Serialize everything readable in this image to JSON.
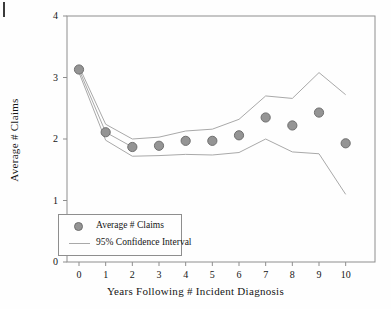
{
  "chart_data": {
    "type": "scatter",
    "title": "",
    "xlabel": "Years Following # Incident Diagnosis",
    "ylabel": "Average # Claims",
    "xlim": [
      -0.45,
      11.1
    ],
    "ylim": [
      0,
      4
    ],
    "xticks": [
      0,
      1,
      2,
      3,
      4,
      5,
      6,
      7,
      8,
      9,
      10
    ],
    "xtick_labels": [
      "0",
      "1",
      "2",
      "3",
      "4",
      "5",
      "6",
      "7",
      "8",
      "9",
      "10"
    ],
    "yticks": [
      0,
      1,
      2,
      3,
      4
    ],
    "ytick_labels": [
      "0",
      "1",
      "2",
      "3",
      "4"
    ],
    "grid": false,
    "legend_position": "lower left",
    "x": [
      0,
      1,
      2,
      3,
      4,
      5,
      6,
      7,
      8,
      9,
      10
    ],
    "series": [
      {
        "name": "Average # Claims",
        "style": "marker",
        "color": "#949494",
        "edge_color": "#6f6f6f",
        "values": [
          3.13,
          2.11,
          1.87,
          1.89,
          1.97,
          1.97,
          2.06,
          2.35,
          2.22,
          2.43,
          1.93
        ]
      },
      {
        "name": "95% Confidence Interval Upper",
        "style": "line",
        "color": "#a9a9a9",
        "values": [
          3.18,
          2.24,
          2.0,
          2.03,
          2.13,
          2.16,
          2.32,
          2.7,
          2.66,
          3.08,
          2.72
        ]
      },
      {
        "name": "95% Confidence Interval Lower",
        "style": "line",
        "color": "#a9a9a9",
        "values": [
          3.08,
          1.98,
          1.72,
          1.73,
          1.75,
          1.74,
          1.78,
          2.0,
          1.79,
          1.76,
          1.1
        ]
      }
    ],
    "legend": [
      {
        "label": "Average # Claims",
        "symbol": "marker"
      },
      {
        "label": "95% Confidence Interval",
        "symbol": "line"
      }
    ],
    "colors": {
      "marker_fill": "#949494",
      "marker_edge": "#6f6f6f",
      "ci_line": "#a9a9a9",
      "axis": "#8e8e8e",
      "text": "#151515",
      "background": "#fefefe"
    }
  }
}
